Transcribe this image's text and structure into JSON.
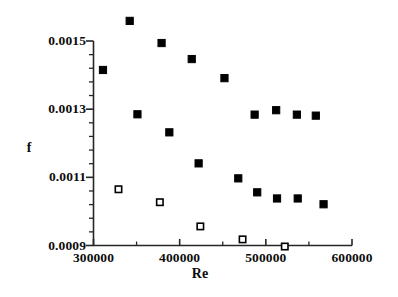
{
  "chart_data": {
    "type": "scatter",
    "title": "",
    "xlabel": "Re",
    "ylabel": "f",
    "xlim": [
      300000,
      600000
    ],
    "ylim": [
      0.0009,
      0.0015
    ],
    "x_ticks": [
      300000,
      400000,
      500000,
      600000
    ],
    "x_tick_labels": [
      "300000",
      "400000",
      "500000",
      "600000"
    ],
    "y_ticks": [
      0.0009,
      0.0011,
      0.0013,
      0.0015
    ],
    "y_tick_labels": [
      "0.0009",
      "0.0011",
      "0.0013",
      "0.0015"
    ],
    "x_minor_tick_count": 4,
    "y_minor_tick_count": 4,
    "grid": false,
    "legend": false,
    "legend_position": "none",
    "series": [
      {
        "name": "filled-squares",
        "marker": "filled-square",
        "color": "#000000",
        "points": [
          {
            "x": 342000,
            "y": 0.001559
          },
          {
            "x": 311000,
            "y": 0.001415
          },
          {
            "x": 379000,
            "y": 0.001494
          },
          {
            "x": 351000,
            "y": 0.001285
          },
          {
            "x": 414000,
            "y": 0.001447
          },
          {
            "x": 388000,
            "y": 0.001232
          },
          {
            "x": 452000,
            "y": 0.001391
          },
          {
            "x": 422000,
            "y": 0.001141
          },
          {
            "x": 487000,
            "y": 0.001284
          },
          {
            "x": 468000,
            "y": 0.001097
          },
          {
            "x": 512000,
            "y": 0.001297
          },
          {
            "x": 490000,
            "y": 0.001056
          },
          {
            "x": 536000,
            "y": 0.001284
          },
          {
            "x": 513000,
            "y": 0.001038
          },
          {
            "x": 558000,
            "y": 0.001281
          },
          {
            "x": 537000,
            "y": 0.001038
          },
          {
            "x": 567000,
            "y": 0.001021
          }
        ]
      },
      {
        "name": "open-squares",
        "marker": "open-square",
        "color": "#000000",
        "points": [
          {
            "x": 329000,
            "y": 0.001065
          },
          {
            "x": 377000,
            "y": 0.001027
          },
          {
            "x": 424000,
            "y": 0.000956
          },
          {
            "x": 473000,
            "y": 0.000918
          },
          {
            "x": 522000,
            "y": 0.000897
          }
        ]
      }
    ]
  },
  "axes": {
    "x_title": "Re",
    "y_title": "f"
  }
}
